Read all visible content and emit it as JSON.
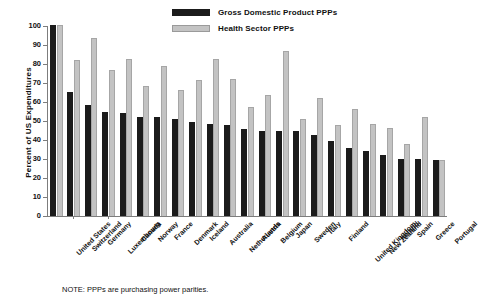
{
  "chart_data": {
    "type": "bar",
    "title": "",
    "xlabel": "",
    "ylabel": "Percent of US Expenditures",
    "ylim": [
      0,
      100
    ],
    "yticks": [
      0,
      10,
      20,
      30,
      40,
      50,
      60,
      70,
      80,
      90,
      100
    ],
    "grid": false,
    "legend_position": "top-center",
    "categories": [
      "United States",
      "Switzerland",
      "Germany",
      "Luxembourg",
      "Canada",
      "Norway",
      "France",
      "Denmark",
      "Iceland",
      "Australia",
      "Netherlands",
      "Austria",
      "Belgium",
      "Japan",
      "Sweden",
      "Italy",
      "Finland",
      "United Kingdom",
      "New Zealand",
      "Ireland",
      "Spain",
      "Greece",
      "Portugal"
    ],
    "series": [
      {
        "name": "Gross Domestic Product PPPs",
        "color": "#1b1b1b",
        "values": [
          100.5,
          65.5,
          58.5,
          55.0,
          54.0,
          52.0,
          52.0,
          51.0,
          49.5,
          48.5,
          48.0,
          46.0,
          45.0,
          45.0,
          44.5,
          42.5,
          39.5,
          36.0,
          34.0,
          32.0,
          30.0,
          30.0,
          29.5
        ]
      },
      {
        "name": "Health Sector PPPs",
        "color": "#c3c3c3",
        "values": [
          100.5,
          82.0,
          93.5,
          77.0,
          82.5,
          68.5,
          79.0,
          66.5,
          71.5,
          82.5,
          72.0,
          57.5,
          63.5,
          87.0,
          51.0,
          62.0,
          48.0,
          56.5,
          48.5,
          46.5,
          38.0,
          52.0,
          29.5
        ]
      }
    ]
  },
  "legend": {
    "items": [
      {
        "label": "Gross Domestic Product PPPs",
        "swatch": "dark"
      },
      {
        "label": "Health Sector PPPs",
        "swatch": "light"
      }
    ]
  },
  "axis": {
    "y_title": "Percent of US Expenditures"
  },
  "note": {
    "text": "NOTE: PPPs are purchasing power parities."
  }
}
